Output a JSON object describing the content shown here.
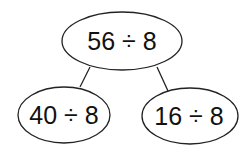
{
  "diagram": {
    "type": "partition-tree",
    "colors": {
      "stroke": "#222222",
      "text": "#111111",
      "background": "#ffffff"
    },
    "root": {
      "label": "56 ÷ 8"
    },
    "children": [
      {
        "label": "40 ÷ 8"
      },
      {
        "label": "16 ÷ 8"
      }
    ]
  }
}
